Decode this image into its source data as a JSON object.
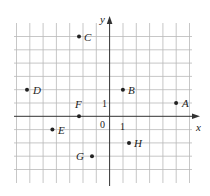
{
  "diagram": {
    "type": "coordinate-plane",
    "axes": {
      "x_label": "x",
      "y_label": "y",
      "origin_label": "0",
      "x_tick_label": "1",
      "y_tick_label": "1"
    },
    "grid": {
      "x_min": -7,
      "x_max": 7,
      "y_min": -5,
      "y_max": 7
    },
    "points": [
      {
        "name": "A",
        "x": 5,
        "y": 1
      },
      {
        "name": "B",
        "x": 1,
        "y": 2
      },
      {
        "name": "C",
        "x": -2,
        "y": 6
      },
      {
        "name": "D",
        "x": -6,
        "y": 2
      },
      {
        "name": "E",
        "x": -4,
        "y": -1
      },
      {
        "name": "F",
        "x": -2,
        "y": 0
      },
      {
        "name": "G",
        "x": -1,
        "y": -3
      },
      {
        "name": "H",
        "x": 2,
        "y": -2
      }
    ]
  }
}
